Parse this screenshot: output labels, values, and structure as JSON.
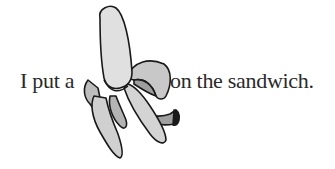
{
  "sentence": {
    "before": "I put a",
    "after": "on the sandwich."
  },
  "image": {
    "subject": "banana-icon",
    "description": "partially peeled banana illustration"
  },
  "colors": {
    "text": "#2a2a2a",
    "banana_fill": "#d8d8d8",
    "peel_shadow": "#a8a8a8",
    "outline": "#1a1a1a",
    "background": "#ffffff"
  }
}
